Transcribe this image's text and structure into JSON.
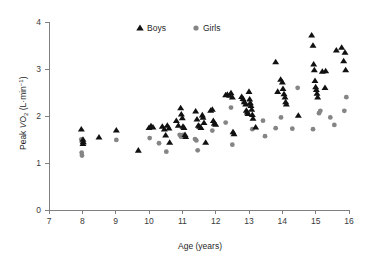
{
  "chart_data": {
    "type": "scatter",
    "title": "",
    "xlabel": "Age (years)",
    "ylabel": "Peak VO2 (L·min-1)",
    "ylabel_parts": {
      "prefix": "Peak ",
      "v": "V",
      "o": "O",
      "o_sub": "2",
      "mid": " (L·min",
      "exp": "−1",
      "suffix": ")"
    },
    "xlim": [
      7,
      16
    ],
    "ylim": [
      0,
      4
    ],
    "xticks": [
      7,
      8,
      9,
      10,
      11,
      12,
      13,
      14,
      15,
      16
    ],
    "xtick_labels": [
      "7",
      "8",
      "9",
      "10",
      "11",
      "12",
      "13",
      "14",
      "15",
      "16"
    ],
    "yticks": [
      0,
      1,
      2,
      3,
      4
    ],
    "ytick_labels": [
      "0",
      "1",
      "2",
      "3",
      "4"
    ],
    "grid": false,
    "legend_position": "top-center",
    "colors": {
      "boys": "#111111",
      "girls": "#858585",
      "axis": "#808080",
      "text": "#1f1f1f",
      "background": "#ffffff"
    },
    "series": [
      {
        "name": "Boys",
        "marker": "triangle",
        "color": "#111111",
        "points": [
          [
            7.97,
            1.72
          ],
          [
            8.02,
            1.5
          ],
          [
            8.03,
            1.45
          ],
          [
            8.02,
            1.41
          ],
          [
            8.5,
            1.55
          ],
          [
            9.02,
            1.7
          ],
          [
            9.68,
            1.27
          ],
          [
            10.0,
            1.75
          ],
          [
            10.06,
            1.79
          ],
          [
            10.12,
            1.76
          ],
          [
            10.4,
            1.78
          ],
          [
            10.46,
            1.72
          ],
          [
            10.5,
            1.59
          ],
          [
            10.55,
            1.8
          ],
          [
            10.6,
            1.74
          ],
          [
            10.62,
            1.44
          ],
          [
            10.82,
            1.9
          ],
          [
            10.88,
            1.8
          ],
          [
            10.95,
            2.17
          ],
          [
            10.97,
            2.04
          ],
          [
            11.0,
            1.96
          ],
          [
            11.02,
            1.78
          ],
          [
            11.05,
            1.75
          ],
          [
            11.08,
            1.6
          ],
          [
            11.1,
            1.56
          ],
          [
            11.4,
            2.1
          ],
          [
            11.44,
            1.93
          ],
          [
            11.48,
            1.8
          ],
          [
            11.52,
            1.78
          ],
          [
            11.56,
            1.75
          ],
          [
            11.6,
            2.02
          ],
          [
            11.62,
            1.97
          ],
          [
            11.65,
            1.86
          ],
          [
            11.7,
            1.44
          ],
          [
            11.85,
            2.12
          ],
          [
            11.9,
            2.14
          ],
          [
            11.93,
            1.9
          ],
          [
            11.96,
            1.84
          ],
          [
            12.0,
            1.82
          ],
          [
            12.3,
            2.45
          ],
          [
            12.35,
            2.46
          ],
          [
            12.42,
            2.44
          ],
          [
            12.46,
            2.49
          ],
          [
            12.5,
            2.4
          ],
          [
            12.52,
            1.66
          ],
          [
            12.55,
            1.62
          ],
          [
            12.78,
            2.41
          ],
          [
            12.82,
            2.37
          ],
          [
            12.86,
            2.3
          ],
          [
            12.9,
            2.25
          ],
          [
            12.92,
            2.12
          ],
          [
            12.95,
            2.08
          ],
          [
            12.97,
            2.05
          ],
          [
            13.0,
            2.52
          ],
          [
            13.02,
            2.36
          ],
          [
            13.04,
            2.28
          ],
          [
            13.06,
            2.22
          ],
          [
            13.08,
            2.14
          ],
          [
            13.1,
            2.03
          ],
          [
            13.12,
            1.95
          ],
          [
            13.2,
            1.76
          ],
          [
            13.8,
            3.15
          ],
          [
            13.86,
            2.52
          ],
          [
            13.95,
            2.78
          ],
          [
            14.0,
            2.72
          ],
          [
            14.02,
            2.58
          ],
          [
            14.05,
            2.47
          ],
          [
            14.08,
            2.4
          ],
          [
            14.1,
            2.3
          ],
          [
            14.12,
            2.25
          ],
          [
            14.48,
            2.01
          ],
          [
            14.88,
            3.72
          ],
          [
            14.92,
            3.5
          ],
          [
            14.94,
            3.1
          ],
          [
            14.96,
            2.98
          ],
          [
            14.98,
            2.75
          ],
          [
            15.0,
            2.62
          ],
          [
            15.02,
            2.56
          ],
          [
            15.04,
            2.48
          ],
          [
            15.06,
            2.4
          ],
          [
            15.2,
            2.95
          ],
          [
            15.28,
            2.6
          ],
          [
            15.3,
            2.96
          ],
          [
            15.62,
            3.4
          ],
          [
            15.78,
            3.46
          ],
          [
            15.84,
            3.17
          ],
          [
            15.88,
            3.35
          ],
          [
            15.9,
            2.98
          ]
        ]
      },
      {
        "name": "Girls",
        "marker": "circle",
        "color": "#858585",
        "points": [
          [
            7.97,
            1.5
          ],
          [
            7.99,
            1.44
          ],
          [
            7.98,
            1.22
          ],
          [
            7.99,
            1.16
          ],
          [
            9.02,
            1.49
          ],
          [
            10.02,
            1.53
          ],
          [
            10.3,
            1.42
          ],
          [
            10.52,
            1.24
          ],
          [
            10.92,
            1.6
          ],
          [
            10.96,
            1.56
          ],
          [
            11.02,
            1.6
          ],
          [
            11.38,
            1.51
          ],
          [
            11.42,
            1.48
          ],
          [
            11.46,
            1.27
          ],
          [
            11.9,
            1.69
          ],
          [
            12.3,
            1.86
          ],
          [
            12.46,
            2.18
          ],
          [
            12.5,
            1.39
          ],
          [
            12.84,
            2.3
          ],
          [
            13.0,
            2.24
          ],
          [
            13.1,
            1.72
          ],
          [
            13.42,
            1.9
          ],
          [
            13.48,
            1.57
          ],
          [
            13.8,
            1.74
          ],
          [
            13.96,
            1.97
          ],
          [
            14.3,
            1.73
          ],
          [
            14.46,
            2.6
          ],
          [
            14.92,
            1.72
          ],
          [
            15.1,
            2.06
          ],
          [
            15.14,
            2.11
          ],
          [
            15.44,
            1.97
          ],
          [
            15.56,
            1.81
          ],
          [
            15.86,
            2.11
          ],
          [
            15.92,
            2.4
          ]
        ]
      }
    ]
  },
  "legend": {
    "items": [
      {
        "label": "Boys",
        "marker": "triangle"
      },
      {
        "label": "Girls",
        "marker": "circle"
      }
    ]
  }
}
